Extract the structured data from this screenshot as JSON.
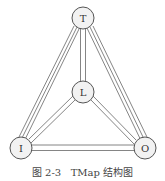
{
  "diagram": {
    "nodes": [
      {
        "id": "T",
        "label": "T",
        "x": 83,
        "y": 18
      },
      {
        "id": "L",
        "label": "L",
        "x": 83,
        "y": 92
      },
      {
        "id": "I",
        "label": "I",
        "x": 21,
        "y": 148
      },
      {
        "id": "O",
        "label": "O",
        "x": 145,
        "y": 148
      }
    ],
    "edges": [
      {
        "from": "T",
        "to": "L",
        "style": "double"
      },
      {
        "from": "T",
        "to": "I",
        "style": "double"
      },
      {
        "from": "T",
        "to": "O",
        "style": "double"
      },
      {
        "from": "L",
        "to": "I",
        "style": "double"
      },
      {
        "from": "L",
        "to": "O",
        "style": "double"
      },
      {
        "from": "I",
        "to": "O",
        "style": "double"
      }
    ],
    "node_radius": 11
  },
  "caption": "图 2-3   TMap 结构图"
}
